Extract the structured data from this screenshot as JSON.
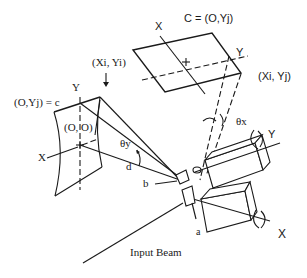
{
  "diagram": {
    "type": "galvanometer-scanner-optics",
    "labels": {
      "top_corner": "C = (O,Yj)",
      "top_x_axis": "X",
      "top_y_axis": "Y",
      "top_point": "(Xi, Yj)",
      "left_corner": "(O,Yj) = c",
      "left_y_axis": "Y",
      "left_origin": "(O, O)",
      "left_x_axis": "X",
      "left_point": "(Xi, Yi)",
      "theta_y": "θy",
      "theta_x": "θx",
      "distance_d": "d",
      "mirror_b": "b",
      "mirror_a": "a",
      "motor_y_axis": "Y",
      "motor_x_axis": "X",
      "input_beam": "Input Beam"
    },
    "parts": [
      "top-projection-plane",
      "curved-left-screen",
      "y-scan-motor",
      "x-scan-motor",
      "mirror-a",
      "mirror-b",
      "input-beam"
    ]
  }
}
